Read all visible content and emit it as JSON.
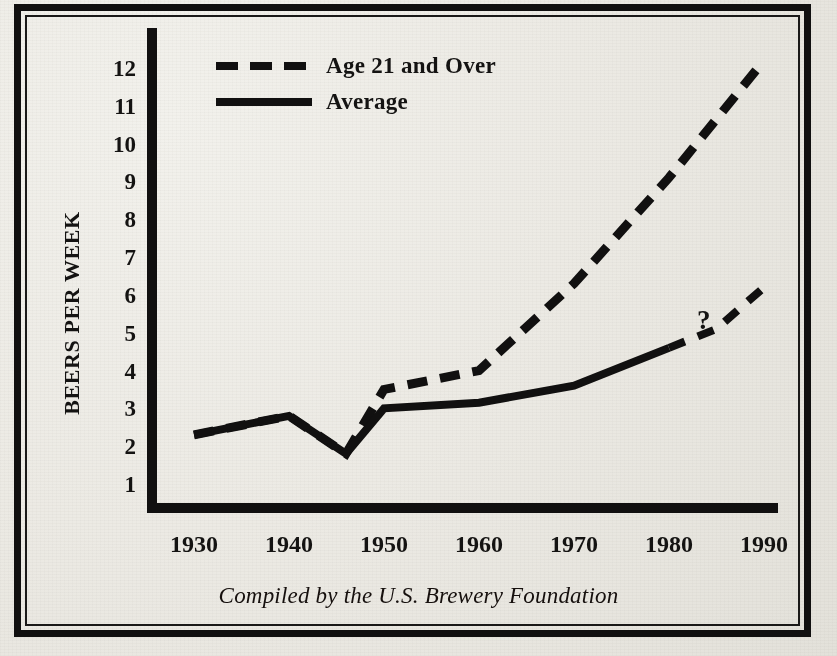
{
  "chart_data": {
    "type": "line",
    "title": "",
    "caption": "Compiled by the U.S. Brewery Foundation",
    "xlabel": "",
    "ylabel": "BEERS PER WEEK",
    "xticks": [
      "1930",
      "1940",
      "1950",
      "1960",
      "1970",
      "1980",
      "1990"
    ],
    "yticks": [
      "1",
      "2",
      "3",
      "4",
      "5",
      "6",
      "7",
      "8",
      "9",
      "10",
      "11",
      "12"
    ],
    "xlim": [
      1926,
      1992
    ],
    "ylim": [
      0,
      12.6
    ],
    "grid": false,
    "legend_position": "top-left-inside",
    "annotations": [
      {
        "text": "?",
        "x": 1985,
        "y": 5.1,
        "series": "Average"
      }
    ],
    "series": [
      {
        "name": "Age 21 and Over",
        "style": "dashed",
        "color": "#111010",
        "x": [
          1930,
          1940,
          1946,
          1950,
          1960,
          1970,
          1980,
          1990
        ],
        "values": [
          2.3,
          2.8,
          1.8,
          3.5,
          4.0,
          6.3,
          9.1,
          12.2
        ]
      },
      {
        "name": "Average",
        "style": "solid",
        "color": "#111010",
        "x": [
          1930,
          1940,
          1946,
          1950,
          1960,
          1970,
          1980,
          1985,
          1990
        ],
        "values": [
          2.3,
          2.8,
          1.8,
          3.0,
          3.15,
          3.6,
          4.6,
          5.1,
          6.2
        ],
        "dashed_from": 1980
      }
    ]
  },
  "legend": {
    "items": [
      {
        "label": "Age 21 and Over",
        "style": "dashed"
      },
      {
        "label": "Average",
        "style": "solid"
      }
    ]
  },
  "colors": {
    "ink": "#111010",
    "paper": "#eceae4"
  }
}
